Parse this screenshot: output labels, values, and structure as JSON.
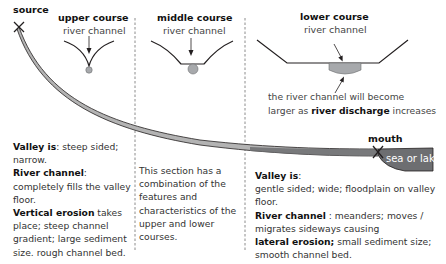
{
  "diagram": {
    "type": "river-long-profile",
    "labels": {
      "source": "source",
      "mouth": "mouth",
      "sea": "sea or lake"
    },
    "sections": {
      "upper": {
        "title": "upper course",
        "channel_label": "river channel",
        "desc": {
          "valley_label": "Valley is",
          "valley_text": ": steep sided; narrow.",
          "channel_label": "River channel",
          "channel_text": ": completely fills the valley floor.",
          "erosion_label": "Vertical erosion",
          "erosion_text": " takes place; steep channel gradient; large sediment size. rough channel bed."
        }
      },
      "middle": {
        "title": "middle course",
        "channel_label": "river channel",
        "desc": "This section has a combination of the features and characteristics of the upper and lower courses."
      },
      "lower": {
        "title": "lower course",
        "channel_label": "river channel",
        "note_line1": "the river channel will become",
        "note_line2_pre": "larger as ",
        "note_line2_bold": "river discharge",
        "note_line2_post": " increases",
        "desc": {
          "valley_label": "Valley is",
          "valley_colon": ":",
          "valley_text": "gentle sided; wide; floodplain on valley floor.",
          "channel_label": "River channel",
          "channel_text": " : meanders; moves / migrates sideways causing",
          "erosion_label": "lateral erosion;",
          "erosion_text": " small sediment size; smooth channel bed."
        }
      }
    },
    "colors": {
      "river_fill": "#b3b3b3",
      "river_dark": "#6d6e71",
      "sea_fill": "#6d6e71",
      "line": "#231f20",
      "divider": "#808080",
      "channel_fill": "#a7a9ac"
    }
  }
}
